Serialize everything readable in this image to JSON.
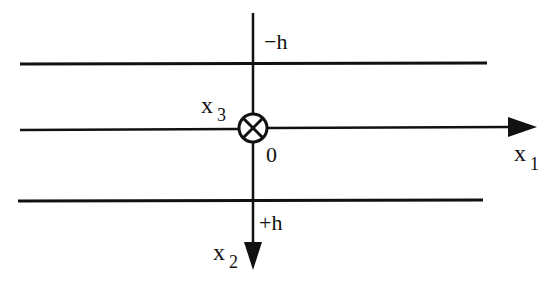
{
  "diagram": {
    "type": "coordinate-axes-layer",
    "labels": {
      "top_boundary": "−h",
      "bottom_boundary": "+h",
      "origin": "0",
      "x1_main": "x",
      "x1_sub": "1",
      "x2_main": "x",
      "x2_sub": "2",
      "x3_main": "x",
      "x3_sub": "3"
    },
    "colors": {
      "stroke": "#111111",
      "background": "#ffffff"
    },
    "elements": [
      {
        "name": "top-boundary-line",
        "y": 64
      },
      {
        "name": "x1-axis",
        "y": 130
      },
      {
        "name": "bottom-boundary-line",
        "y": 201
      },
      {
        "name": "x2-axis",
        "x": 253
      },
      {
        "name": "x3-into-page-symbol",
        "cx": 253,
        "cy": 128
      }
    ]
  }
}
